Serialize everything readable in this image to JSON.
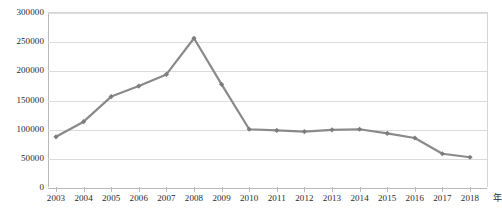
{
  "chart_data": {
    "type": "line",
    "title": "",
    "xlabel": "年",
    "ylabel": "",
    "categories": [
      "2003",
      "2004",
      "2005",
      "2006",
      "2007",
      "2008",
      "2009",
      "2010",
      "2011",
      "2012",
      "2013",
      "2014",
      "2015",
      "2016",
      "2017",
      "2018"
    ],
    "values": [
      86000,
      112000,
      155000,
      173000,
      193000,
      255000,
      176000,
      99000,
      97000,
      95000,
      98000,
      99000,
      92000,
      84000,
      57000,
      51000
    ],
    "series": [
      {
        "name": "",
        "values": [
          86000,
          112000,
          155000,
          173000,
          193000,
          255000,
          176000,
          99000,
          97000,
          95000,
          98000,
          99000,
          92000,
          84000,
          57000,
          51000
        ]
      }
    ],
    "ylim": [
      0,
      300000
    ],
    "y_ticks": [
      0,
      50000,
      100000,
      150000,
      200000,
      250000,
      300000
    ],
    "y_tick_labels": [
      "0",
      "50000",
      "100000",
      "150000",
      "200000",
      "250000",
      "300000"
    ],
    "x_tick_labels": [
      "2003",
      "2004",
      "2005",
      "2006",
      "2007",
      "2008",
      "2009",
      "2010",
      "2011",
      "2012",
      "2013",
      "2014",
      "2015",
      "2016",
      "2017",
      "2018"
    ],
    "grid": true,
    "legend": false,
    "legend_position": "none",
    "marker": "diamond",
    "line_color": "#8a8a8a",
    "marker_color": "#7d7d7d",
    "grid_color": "#dcdcdc",
    "axis_color": "#b9b9b9",
    "text_color": "#2b2b2b",
    "background": "#ffffff",
    "x_unit_label": "年"
  }
}
